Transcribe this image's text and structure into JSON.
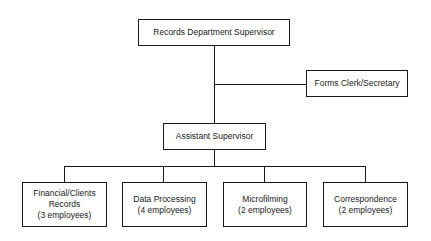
{
  "chart": {
    "supervisor": {
      "label": "Records Department Supervisor"
    },
    "staff": {
      "label": "Forms Clerk/Secretary"
    },
    "assistant": {
      "label": "Assistant Supervisor"
    },
    "units": [
      {
        "line1": "Financial/Clients",
        "line2": "Records",
        "line3": "(3 employees)"
      },
      {
        "line1": "Data Processing",
        "line2": "(4 employees)"
      },
      {
        "line1": "Microfilming",
        "line2": "(2 employees)"
      },
      {
        "line1": "Correspondence",
        "line2": "(2 employees)"
      }
    ]
  }
}
